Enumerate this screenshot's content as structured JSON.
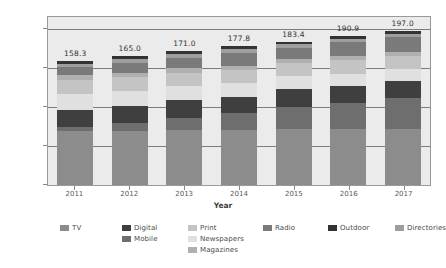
{
  "chart_data": {
    "type": "bar",
    "stacked": true,
    "title": "",
    "xlabel": "Year",
    "ylabel": "Billions ($)",
    "categories": [
      "2011",
      "2012",
      "2013",
      "2014",
      "2015",
      "2016",
      "2017"
    ],
    "ylim": [
      0,
      215
    ],
    "yticks": [
      0,
      50,
      100,
      150,
      200
    ],
    "ytick_labels": [
      "0",
      "50",
      "100",
      "150",
      "200"
    ],
    "grid": true,
    "legend_position": "bottom",
    "totals": [
      "158.3",
      "165.0",
      "171.0",
      "177.8",
      "183.4",
      "190.9",
      "197.0"
    ],
    "series": [
      {
        "name": "TV",
        "color": "#8c8c8c",
        "values": [
          68.5,
          69.5,
          70.5,
          71.0,
          71.5,
          71.5,
          71.5
        ]
      },
      {
        "name": "Mobile",
        "color": "#6e6e6e",
        "values": [
          6.0,
          10.5,
          15.5,
          21.0,
          28.5,
          34.0,
          40.5
        ]
      },
      {
        "name": "Digital",
        "color": "#3f3f3f",
        "values": [
          21.5,
          20.5,
          22.5,
          20.5,
          23.5,
          21.5,
          21.0
        ]
      },
      {
        "name": "Newspapers",
        "color": "#e0e0e0",
        "values": [
          21.0,
          20.0,
          18.5,
          17.5,
          16.0,
          15.5,
          15.0
        ]
      },
      {
        "name": "Print",
        "color": "#c4c4c4",
        "values": [
          18.0,
          17.5,
          17.0,
          17.0,
          16.5,
          17.0,
          17.0
        ]
      },
      {
        "name": "Magazines",
        "color": "#b0b0b0",
        "values": [
          5.5,
          5.5,
          5.5,
          5.5,
          5.5,
          5.5,
          5.5
        ]
      },
      {
        "name": "Radio",
        "color": "#7a7a7a",
        "values": [
          11.0,
          13.0,
          13.0,
          17.0,
          14.5,
          18.0,
          18.5
        ]
      },
      {
        "name": "Directories",
        "color": "#9e9e9e",
        "values": [
          3.8,
          5.0,
          5.0,
          4.8,
          3.9,
          4.4,
          4.5
        ]
      },
      {
        "name": "Outdoor",
        "color": "#333333",
        "values": [
          3.0,
          3.5,
          3.5,
          3.5,
          3.5,
          3.5,
          3.5
        ]
      }
    ]
  },
  "legend": {
    "row1": [
      {
        "label": "TV",
        "color": "#8c8c8c"
      },
      {
        "label": "Digital",
        "color": "#3f3f3f"
      },
      {
        "label": "Print",
        "color": "#c4c4c4"
      },
      {
        "label": "Radio",
        "color": "#7a7a7a"
      },
      {
        "label": "Outdoor",
        "color": "#333333"
      },
      {
        "label": "Directories",
        "color": "#9e9e9e"
      }
    ],
    "row2": [
      {
        "label": "Mobile",
        "color": "#6e6e6e"
      },
      {
        "label": "Newspapers",
        "color": "#e0e0e0"
      }
    ],
    "row3": [
      {
        "label": "Magazines",
        "color": "#b0b0b0"
      }
    ]
  },
  "colors": {
    "plot_background": "#ebebeb",
    "figure_background": "#ffffff",
    "gridline": "#7d7d7d",
    "axis_text": "#5a5a5a",
    "label_text": "#333333"
  }
}
